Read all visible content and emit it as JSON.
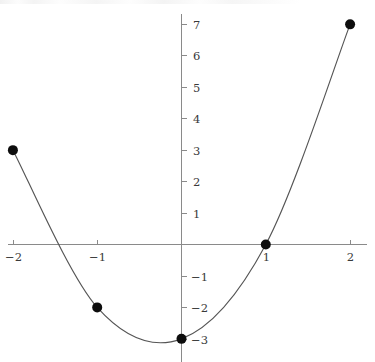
{
  "chart_data": {
    "type": "line",
    "title": "",
    "subtitle": "",
    "xlabel": "",
    "ylabel": "",
    "x": [
      -2,
      -1,
      0,
      1,
      2
    ],
    "values": [
      3,
      -2,
      -3,
      0,
      7
    ],
    "series": [
      {
        "name": "",
        "points": [
          {
            "x": -2,
            "y": 3
          },
          {
            "x": -1,
            "y": -2
          },
          {
            "x": 0,
            "y": -3
          },
          {
            "x": 1,
            "y": 0
          },
          {
            "x": 2,
            "y": 7
          }
        ]
      }
    ],
    "xlim": [
      -2.07,
      2.19
    ],
    "ylim": [
      -3.78,
      7.32
    ],
    "x_ticks": [
      -2,
      -1,
      1,
      2
    ],
    "y_ticks": [
      7,
      6,
      5,
      4,
      3,
      2,
      1,
      -1,
      -2,
      -3
    ],
    "x_tick_labels": [
      "−2",
      "−1",
      "1",
      "2"
    ],
    "y_tick_labels": [
      "7",
      "6",
      "5",
      "4",
      "3",
      "2",
      "1",
      "−1",
      "−2",
      "−3"
    ],
    "grid": false,
    "legend": null,
    "legend_position": "none",
    "markers": "filled-circle",
    "annotations": [],
    "colors": {
      "curve": "#555555",
      "marker": "#0d0d0d",
      "axis": "#8a8a8a",
      "tick_text": "#3a3a3a",
      "background": "#ffffff"
    }
  },
  "axes": {
    "x_axis_name": "x-axis",
    "y_axis_name": "y-axis"
  }
}
